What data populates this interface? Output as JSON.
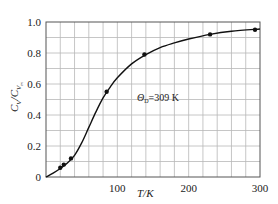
{
  "chart_data": {
    "type": "line",
    "title": "",
    "xlabel": "T/K",
    "ylabel": "C_V/C_V,m",
    "xlim": [
      0,
      300
    ],
    "ylim": [
      0,
      1.0
    ],
    "x_ticks": [
      0,
      100,
      200,
      300
    ],
    "x_tick_labels": [
      "",
      "100",
      "200",
      "300"
    ],
    "y_ticks": [
      0,
      0.2,
      0.4,
      0.6,
      0.8,
      1.0
    ],
    "y_tick_labels": [
      "0",
      "0.2",
      "0.4",
      "0.6",
      "0.8",
      "1.0"
    ],
    "grid": true,
    "grid_x_step": 20,
    "grid_y_step": 0.1,
    "annotation": "Θ_D=309 K",
    "series": [
      {
        "name": "Debye curve",
        "style": "line",
        "x": [
          0,
          10,
          20,
          30,
          40,
          50,
          60,
          70,
          80,
          90,
          100,
          120,
          140,
          160,
          180,
          200,
          230,
          260,
          300
        ],
        "values": [
          0,
          0.025,
          0.055,
          0.09,
          0.14,
          0.22,
          0.32,
          0.42,
          0.51,
          0.58,
          0.64,
          0.73,
          0.79,
          0.835,
          0.865,
          0.89,
          0.92,
          0.94,
          0.955
        ]
      },
      {
        "name": "experimental points",
        "style": "scatter",
        "x": [
          20,
          25,
          35,
          85,
          138,
          230,
          293
        ],
        "values": [
          0.06,
          0.08,
          0.12,
          0.55,
          0.79,
          0.92,
          0.95
        ]
      }
    ]
  },
  "labels": {
    "x_axis": "T/K",
    "y_axis_main": "C",
    "y_axis_sub1": "V",
    "y_axis_slash": "/C",
    "y_axis_sub2": "V",
    "y_axis_sub3": "m",
    "annotation_theta": "Θ",
    "annotation_sub": "D",
    "annotation_value": "=309 K",
    "origin": "0"
  },
  "colors": {
    "grid": "#b8b8b8",
    "frame": "#555555",
    "curve": "#111111",
    "points": "#111111"
  }
}
